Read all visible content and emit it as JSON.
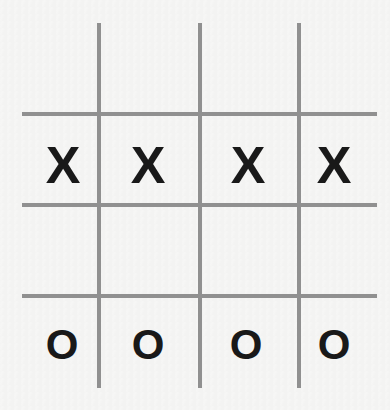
{
  "board": {
    "title": "Tic Tac Toe Grid",
    "width": 390,
    "height": 410,
    "background_color": "#f6f6f5",
    "line_color": "#909090",
    "mark_color": "#191919"
  },
  "grid": {
    "vertical_lines": [
      {
        "name": "vertical-line-1",
        "x": 97,
        "y": 23,
        "length": 365,
        "thickness": 4
      },
      {
        "name": "vertical-line-2",
        "x": 198,
        "y": 23,
        "length": 365,
        "thickness": 4
      },
      {
        "name": "vertical-line-3",
        "x": 297,
        "y": 23,
        "length": 365,
        "thickness": 4
      }
    ],
    "horizontal_lines": [
      {
        "name": "horizontal-line-1",
        "x": 22,
        "y": 112,
        "length": 355,
        "thickness": 4
      },
      {
        "name": "horizontal-line-2",
        "x": 22,
        "y": 203,
        "length": 355,
        "thickness": 4
      },
      {
        "name": "horizontal-line-3",
        "x": 22,
        "y": 294,
        "length": 355,
        "thickness": 4
      }
    ]
  },
  "marks": {
    "row_x": {
      "label": "X",
      "symbol": "X",
      "y": 139,
      "cells": [
        {
          "name": "mark-x-1",
          "symbol": "X",
          "x": 41
        },
        {
          "name": "mark-x-2",
          "symbol": "X",
          "x": 126
        },
        {
          "name": "mark-x-3",
          "symbol": "X",
          "x": 226
        },
        {
          "name": "mark-x-4",
          "symbol": "X",
          "x": 312
        }
      ]
    },
    "row_o": {
      "label": "O",
      "symbol": "O",
      "y": 324,
      "cells": [
        {
          "name": "mark-o-1",
          "symbol": "O",
          "x": 42
        },
        {
          "name": "mark-o-2",
          "symbol": "O",
          "x": 128
        },
        {
          "name": "mark-o-3",
          "symbol": "O",
          "x": 226
        },
        {
          "name": "mark-o-4",
          "symbol": "O",
          "x": 314
        }
      ]
    }
  }
}
